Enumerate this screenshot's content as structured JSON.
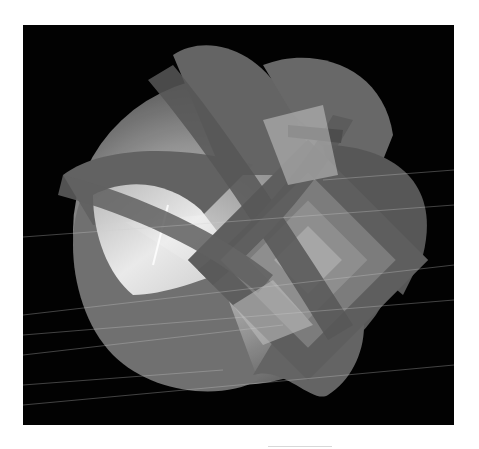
{
  "figure": {
    "background_color": "#020202",
    "page_color": "#ffffff",
    "surface_colors": {
      "dark_band": "#5a5a5a",
      "mid_gray": "#7a7a7a",
      "light_gray": "#a8a8a8",
      "highlight": "#e6e6e6"
    }
  }
}
